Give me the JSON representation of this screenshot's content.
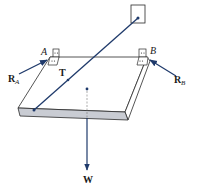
{
  "figure": {
    "labels": {
      "point_a": "A",
      "point_b": "B",
      "reaction_a": "R",
      "reaction_a_sub": "A",
      "reaction_b": "R",
      "reaction_b_sub": "B",
      "tension": "T",
      "weight": "W"
    },
    "colors": {
      "force_arrow": "#1f3a6b",
      "plate_front": "#c9ccd3",
      "line": "#2a2a2a"
    }
  }
}
